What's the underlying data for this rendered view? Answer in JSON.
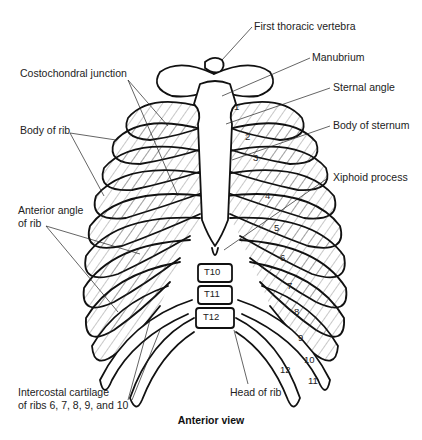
{
  "figure": {
    "caption": "Anterior view",
    "labels": {
      "first_thoracic_vertebra": "First thoracic vertebra",
      "manubrium": "Manubrium",
      "sternal_angle": "Sternal angle",
      "body_of_sternum": "Body of sternum",
      "xiphoid_process": "Xiphoid process",
      "costochondral_junction": "Costochondral junction",
      "body_of_rib": "Body of rib",
      "anterior_angle_line1": "Anterior angle",
      "anterior_angle_line2": "of rib",
      "intercostal_line1": "Intercostal cartilage",
      "intercostal_line2": "of ribs 6, 7, 8, 9, and 10",
      "head_of_rib": "Head of rib"
    },
    "rib_numbers": [
      "1",
      "2",
      "3",
      "4",
      "5",
      "6",
      "7",
      "8",
      "9",
      "10",
      "11",
      "12"
    ],
    "vertebrae": [
      "T10",
      "T11",
      "T12"
    ]
  }
}
